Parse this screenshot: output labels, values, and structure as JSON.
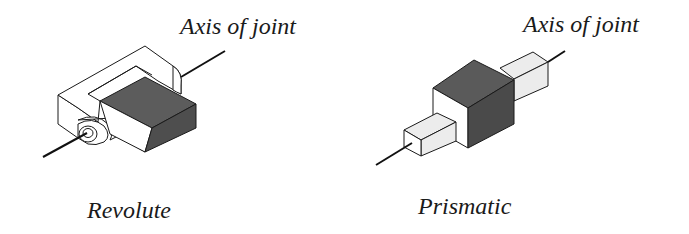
{
  "figure": {
    "panels": [
      {
        "id": "revolute",
        "axis_label": "Axis of joint",
        "name": "Revolute"
      },
      {
        "id": "prismatic",
        "axis_label": "Axis of joint",
        "name": "Prismatic"
      }
    ],
    "colors": {
      "background": "#ffffff",
      "outline": "#1a1a1a",
      "light_face": "#ffffff",
      "pale_face": "#ececec",
      "dark_top": "#5a5a5a",
      "dark_side": "#4a4a4a",
      "axis_line": "#111111"
    }
  }
}
